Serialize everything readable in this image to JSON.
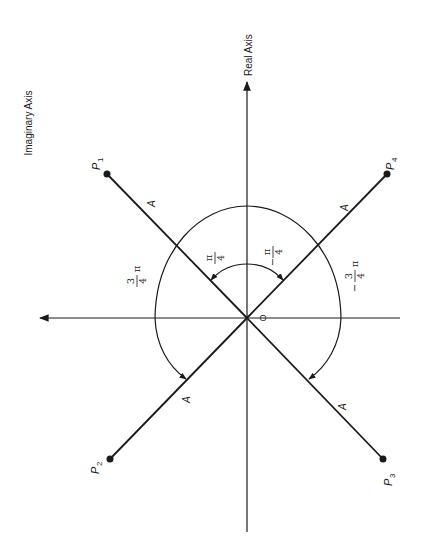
{
  "diagram": {
    "axes": {
      "real_label": "Real Axis",
      "imag_label": "Imaginary Axis",
      "origin_label": "O"
    },
    "points": [
      {
        "name": "P",
        "sub": "1"
      },
      {
        "name": "P",
        "sub": "2"
      },
      {
        "name": "P",
        "sub": "3"
      },
      {
        "name": "P",
        "sub": "4"
      }
    ],
    "magnitude_label": "A",
    "angles": {
      "pi_over_4": {
        "num": "π",
        "den": "4",
        "sign": ""
      },
      "neg_pi_over_4": {
        "num": "π",
        "den": "4",
        "sign": "−"
      },
      "three_pi_over_4": {
        "num": "3",
        "den": "4",
        "suffix": "π",
        "sign": ""
      },
      "neg_three_pi_over_4": {
        "num": "3",
        "den": "4",
        "suffix": "π",
        "sign": "−"
      }
    }
  }
}
